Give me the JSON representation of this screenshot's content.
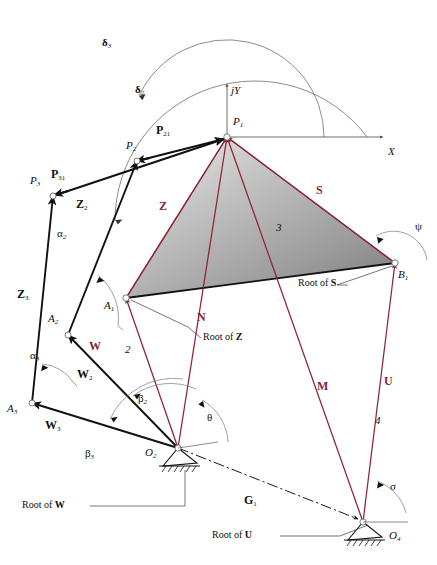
{
  "figure": {
    "colors": {
      "vector_red": "#8d2433",
      "link_black": "#111111",
      "construction_gray": "#6b6b6b",
      "body_fill_light": "#d9d9d9",
      "body_fill_dark": "#8a8a8a"
    }
  },
  "axes": {
    "x_label": "X",
    "y_label": "jY",
    "origin_point": "P1"
  },
  "points": [
    {
      "name": "P1",
      "label": "P",
      "sub": "1",
      "x": 227,
      "y": 137
    },
    {
      "name": "P2",
      "label": "P",
      "sub": "2",
      "x": 137,
      "y": 161
    },
    {
      "name": "P3",
      "label": "P",
      "sub": "3",
      "x": 53,
      "y": 196
    },
    {
      "name": "A1",
      "label": "A",
      "sub": "1",
      "x": 126,
      "y": 298
    },
    {
      "name": "A2",
      "label": "A",
      "sub": "2",
      "x": 68,
      "y": 335
    },
    {
      "name": "A3",
      "label": "A",
      "sub": "3",
      "x": 32,
      "y": 403
    },
    {
      "name": "B1",
      "label": "B",
      "sub": "1",
      "x": 395,
      "y": 263
    },
    {
      "name": "O2",
      "label": "O",
      "sub": "2",
      "x": 178,
      "y": 448
    },
    {
      "name": "O4",
      "label": "O",
      "sub": "4",
      "x": 363,
      "y": 522
    }
  ],
  "vectors": {
    "red": [
      {
        "name": "Z",
        "label": "Z",
        "from": "A1",
        "to": "P1"
      },
      {
        "name": "S",
        "label": "S",
        "from": "B1",
        "to": "P1"
      },
      {
        "name": "N",
        "label": "N",
        "from": "O2",
        "to": "P1"
      },
      {
        "name": "M",
        "label": "M",
        "from": "O4",
        "to": "P1"
      },
      {
        "name": "W",
        "label": "W",
        "from": "O2",
        "to": "A1"
      },
      {
        "name": "U",
        "label": "U",
        "from": "O4",
        "to": "B1"
      }
    ],
    "black": [
      {
        "name": "P21",
        "label": "P",
        "sub": "21",
        "from": "P2",
        "to": "P1"
      },
      {
        "name": "P31",
        "label": "P",
        "sub": "31",
        "from": "P3",
        "to": "P1"
      },
      {
        "name": "Z2",
        "label": "Z",
        "sub": "2",
        "from": "A2",
        "to": "P2"
      },
      {
        "name": "Z3",
        "label": "Z",
        "sub": "3",
        "from": "A3",
        "to": "P3"
      },
      {
        "name": "W2",
        "label": "W",
        "sub": "2",
        "from": "O2",
        "to": "A2"
      },
      {
        "name": "W3",
        "label": "W",
        "sub": "3",
        "from": "O2",
        "to": "A3"
      },
      {
        "name": "G1",
        "label": "G",
        "sub": "1",
        "from": "O2",
        "to": "O4"
      }
    ]
  },
  "link_numbers": [
    {
      "name": "link-2",
      "label": "2"
    },
    {
      "name": "link-3",
      "label": "3"
    },
    {
      "name": "link-4",
      "label": "4"
    }
  ],
  "angles": [
    {
      "name": "delta2",
      "label": "δ",
      "sub": "2"
    },
    {
      "name": "delta3",
      "label": "δ",
      "sub": "3"
    },
    {
      "name": "alpha2",
      "label": "α",
      "sub": "2"
    },
    {
      "name": "alpha3",
      "label": "α",
      "sub": "3"
    },
    {
      "name": "beta2",
      "label": "β",
      "sub": "2"
    },
    {
      "name": "beta3",
      "label": "β",
      "sub": "3"
    },
    {
      "name": "theta",
      "label": "θ",
      "sub": ""
    },
    {
      "name": "psi",
      "label": "ψ",
      "sub": ""
    },
    {
      "name": "sigma",
      "label": "σ",
      "sub": ""
    }
  ],
  "callouts": [
    {
      "name": "root-of-z",
      "text": "Root of",
      "vector": "Z"
    },
    {
      "name": "root-of-w",
      "text": "Root of",
      "vector": "W"
    },
    {
      "name": "root-of-s",
      "text": "Root of",
      "vector": "S"
    },
    {
      "name": "root-of-u",
      "text": "Root of",
      "vector": "U"
    }
  ]
}
